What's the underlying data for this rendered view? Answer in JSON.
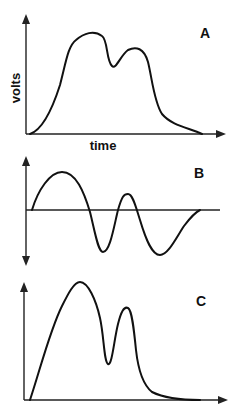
{
  "diagram": {
    "panels": [
      {
        "id": "A",
        "label": "A",
        "y_axis_label": "volts",
        "x_axis_label": "time",
        "description": "Double-humped positive waveform: large first peak, dip, smaller second peak, then decay to baseline"
      },
      {
        "id": "B",
        "label": "B",
        "description": "Biphasic oscillating waveform: positive hump, then negative trough, small positive peak, deeper negative trough, return to baseline"
      },
      {
        "id": "C",
        "label": "C",
        "description": "Double-peaked positive waveform with a deep notch between a tall first peak and a narrower second peak, then decay to baseline"
      }
    ]
  }
}
